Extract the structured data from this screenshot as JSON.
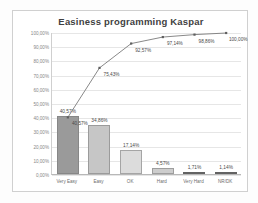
{
  "chart_data": {
    "type": "bar",
    "title": "Easiness programming Kaspar",
    "xlabel": "",
    "ylabel": "",
    "ylim": [
      0,
      100
    ],
    "ytick_step": 10,
    "grid": true,
    "legend": "none",
    "categories": [
      "Very Easy",
      "Easy",
      "OK",
      "Hard",
      "Very Hard",
      "NR/DK"
    ],
    "ytick_labels": [
      "0,00%",
      "10,00%",
      "20,00%",
      "30,00%",
      "40,00%",
      "50,00%",
      "60,00%",
      "70,00%",
      "80,00%",
      "90,00%",
      "100,00%"
    ],
    "series": [
      {
        "name": "Frequency",
        "kind": "bar",
        "values": [
          40.57,
          34.86,
          17.14,
          4.57,
          1.71,
          1.14
        ],
        "labels": [
          "40,57%",
          "34,86%",
          "17,14%",
          "4,57%",
          "1,71%",
          "1,14%"
        ],
        "colors": [
          "#9a9a9a",
          "#c6c6c6",
          "#dcdcdc",
          "#cdcdcd",
          "#4a4a4a",
          "#4a4a4a"
        ]
      },
      {
        "name": "Cumulative",
        "kind": "line",
        "values": [
          40.57,
          75.43,
          92.57,
          97.14,
          98.86,
          100.0
        ],
        "labels": [
          "40,57%",
          "75,43%",
          "92,57%",
          "97,14%",
          "98,86%",
          "100,00%"
        ],
        "color": "#7b7b7b"
      }
    ]
  },
  "colors": {
    "frame_border": "#d0d0d0",
    "gridline": "#e6e6e6",
    "axis": "#b8b8b8",
    "title_text": "#3f3f3f",
    "tick_text": "#868686",
    "label_text": "#4a4a4a",
    "line": "#7b7b7b",
    "plot_background": "#ffffff"
  }
}
